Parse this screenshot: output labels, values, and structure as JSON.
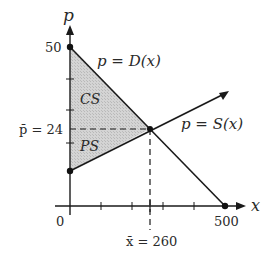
{
  "diagram": {
    "axes": {
      "x_label": "x",
      "y_label": "p",
      "origin_label": "0"
    },
    "y_ticks": {
      "top_value": "50",
      "pbar_label": "p̄ = 24"
    },
    "x_ticks": {
      "xbar_label": "x̄ = 260",
      "end_value": "500"
    },
    "curves": {
      "demand_label": "p = D(x)",
      "supply_label": "p = S(x)"
    },
    "regions": {
      "consumer_surplus": "CS",
      "producer_surplus": "PS"
    },
    "colors": {
      "shade": "#c8c8c8",
      "line": "#1a1a1a"
    }
  }
}
